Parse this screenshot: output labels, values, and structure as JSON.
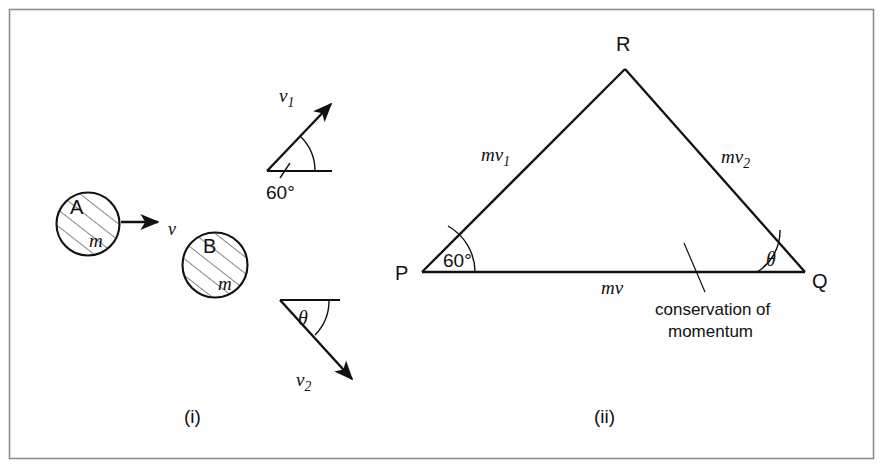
{
  "figure": {
    "panels": [
      {
        "id": "panel-i",
        "caption": "(i)",
        "description": "two equal masses before and after collision with velocity vectors",
        "bodies": [
          {
            "name": "A",
            "mass_label": "m"
          },
          {
            "name": "B",
            "mass_label": "m"
          }
        ],
        "vectors": [
          {
            "name": "v",
            "label": "v"
          },
          {
            "name": "v1",
            "label": "v",
            "subscript": "1"
          },
          {
            "name": "v2",
            "label": "v",
            "subscript": "2"
          }
        ],
        "angles": [
          {
            "name": "angle-above",
            "label": "60°"
          },
          {
            "name": "angle-below",
            "label": "θ"
          }
        ]
      },
      {
        "id": "panel-ii",
        "caption": "(ii)",
        "description": "closed vector triangle PQR showing momentum conservation",
        "vertices": [
          {
            "name": "P",
            "label": "P"
          },
          {
            "name": "Q",
            "label": "Q"
          },
          {
            "name": "R",
            "label": "R"
          }
        ],
        "vectors": [
          {
            "name": "mv",
            "label": "mv"
          },
          {
            "name": "mv1",
            "label": "mv",
            "subscript": "1"
          },
          {
            "name": "mv2",
            "label": "mv",
            "subscript": "2"
          }
        ],
        "angles": [
          {
            "name": "angle-P",
            "label": "60°"
          },
          {
            "name": "angle-Q",
            "label": "θ"
          }
        ],
        "annotation": {
          "line1": "conservation of",
          "line2": "momentum"
        }
      }
    ]
  },
  "colors": {
    "ink": "#111111",
    "frame": "#8e8e93",
    "paper": "#fefefe",
    "faint": "#c9c9cd"
  }
}
